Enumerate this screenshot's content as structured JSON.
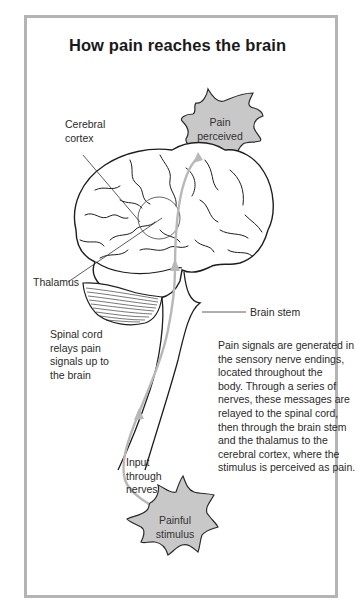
{
  "title": "How pain reaches the brain",
  "labels": {
    "cerebral_cortex": [
      "Cerebral",
      "cortex"
    ],
    "pain_perceived": [
      "Pain",
      "perceived"
    ],
    "thalamus": "Thalamus",
    "brain_stem": "Brain stem",
    "spinal_cord": [
      "Spinal cord",
      "relays pain",
      "signals up to",
      "the brain"
    ],
    "input_nerves": [
      "Input",
      "through",
      "nerves"
    ],
    "painful_stimulus": [
      "Painful",
      "stimulus"
    ]
  },
  "description": [
    "Pain signals are generated in",
    "the sensory nerve endings,",
    "located throughout the",
    "body. Through a series of",
    "nerves, these messages are",
    "relayed to the spinal cord,",
    "then through the brain stem",
    "and the thalamus to the",
    "cerebral cortex, where the",
    "stimulus is perceived as pain."
  ],
  "colors": {
    "frame_border": "#b4b4b4",
    "blob_fill": "#c8c8c8",
    "pathway_arrow": "#b8b8b8",
    "outline": "#1e1e1e"
  }
}
